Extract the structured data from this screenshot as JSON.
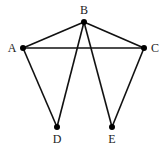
{
  "graph": {
    "nodes": [
      {
        "id": "A",
        "label": "A",
        "x": 23,
        "y": 48,
        "lx": 12,
        "ly": 52
      },
      {
        "id": "B",
        "label": "B",
        "x": 84,
        "y": 22,
        "lx": 84,
        "ly": 14
      },
      {
        "id": "C",
        "label": "C",
        "x": 144,
        "y": 48,
        "lx": 155,
        "ly": 52
      },
      {
        "id": "D",
        "label": "D",
        "x": 57,
        "y": 127,
        "lx": 57,
        "ly": 143
      },
      {
        "id": "E",
        "label": "E",
        "x": 112,
        "y": 127,
        "lx": 112,
        "ly": 143
      }
    ],
    "edges": [
      [
        "A",
        "B"
      ],
      [
        "B",
        "C"
      ],
      [
        "A",
        "C"
      ],
      [
        "A",
        "D"
      ],
      [
        "B",
        "D"
      ],
      [
        "B",
        "E"
      ],
      [
        "C",
        "E"
      ]
    ]
  },
  "colors": {
    "edge": "#111111",
    "node": "#000000",
    "label": "#222222",
    "background": "#ffffff"
  }
}
